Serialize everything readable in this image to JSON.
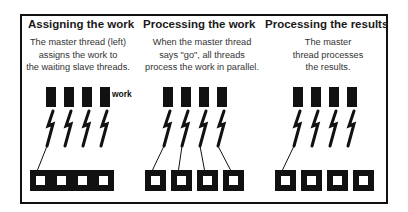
{
  "colors": {
    "ink": "#111111",
    "text": "#333333",
    "background": "#ffffff"
  },
  "panels": [
    {
      "title": "Assigning the work",
      "description": "The master thread (left)\nassigns the work to\nthe waiting slave threads.",
      "work_label": "work",
      "threads": 4,
      "work_items": 4,
      "connections": [
        {
          "from_thread": 0,
          "to_bolt": 0
        }
      ]
    },
    {
      "title": "Processing the work",
      "description": "When the master thread\nsays \"go\", all threads\nprocess the work in parallel.",
      "work_label": "",
      "threads": 4,
      "work_items": 4,
      "connections": [
        {
          "from_thread": 0,
          "to_bolt": 0
        },
        {
          "from_thread": 1,
          "to_bolt": 1
        },
        {
          "from_thread": 2,
          "to_bolt": 2
        },
        {
          "from_thread": 3,
          "to_bolt": 3
        }
      ]
    },
    {
      "title": "Processing the results",
      "description": "The master\nthread processes\nthe results.",
      "work_label": "",
      "threads": 4,
      "work_items": 4,
      "connections": [
        {
          "from_thread": 0,
          "to_bolt": 0
        }
      ]
    }
  ]
}
